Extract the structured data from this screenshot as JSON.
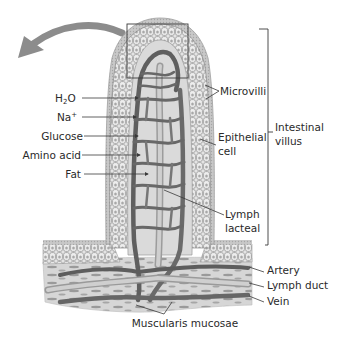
{
  "diagram": {
    "title": "Intestinal villus",
    "colors": {
      "background": "#ffffff",
      "epithelium": "#c9c9c9",
      "epithelium_cell_fill": "#e6e6e6",
      "cell_outline": "#8a8a8a",
      "core": "#dcdcdc",
      "vessel": "#6e6e6e",
      "vessel_dark": "#555555",
      "muscle": "#bdbdbd",
      "leader_line": "#3a3a3a",
      "arrow": "#8c8c8c",
      "text": "#2a2a2a"
    },
    "arrow": {
      "icon": "curved-arrow-left-icon"
    },
    "inset_box": {
      "icon": "zoom-region-box"
    },
    "left_labels": {
      "h2o": {
        "main": "H",
        "sub": "2",
        "tail": "O"
      },
      "na": {
        "main": "Na",
        "sup": "+"
      },
      "glucose": "Glucose",
      "amino_acid": "Amino acid",
      "fat": "Fat"
    },
    "right_labels": {
      "microvilli": "Microvilli",
      "epithelial_cell": {
        "line1": "Epithelial",
        "line2": "cell"
      },
      "intestinal_villus": {
        "line1": "Intestinal",
        "line2": "villus"
      },
      "lymph_lacteal": {
        "line1": "Lymph",
        "line2": "lacteal"
      },
      "artery": "Artery",
      "lymph_duct": "Lymph duct",
      "vein": "Vein"
    },
    "bottom_labels": {
      "muscularis_mucosae": "Muscularis mucosae"
    }
  }
}
